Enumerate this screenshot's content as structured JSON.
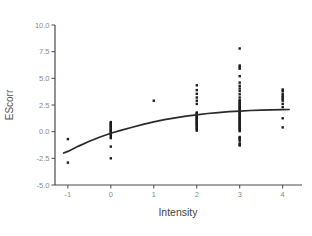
{
  "chart_data": {
    "type": "scatter",
    "title": "",
    "xlabel": "Intensity",
    "ylabel": "EScorr",
    "xlim": [
      -1.3,
      4.45
    ],
    "ylim": [
      -5,
      10
    ],
    "grid": false,
    "legend": null,
    "x_ticks": [
      "-1",
      "0",
      "1",
      "2",
      "3",
      "4"
    ],
    "x_tick_values": [
      -1,
      0,
      1,
      2,
      3,
      4
    ],
    "y_ticks": [
      "10.0",
      "7.5",
      "5.0",
      "2.5",
      "0.0",
      "-2.5",
      "-5.0"
    ],
    "y_tick_values": [
      10,
      7.5,
      5,
      2.5,
      0,
      -2.5,
      -5
    ],
    "point_color": "#1c1c1c",
    "curve_color": "#2a2a2a",
    "axis_color": "#4a4a4a",
    "tick_label_color": "#8a8a8a",
    "series": [
      {
        "name": "observations",
        "type": "scatter",
        "groups": [
          {
            "x": -1,
            "y": [
              -0.7,
              -2.9
            ]
          },
          {
            "x": 0,
            "y": [
              0.9,
              0.8,
              0.7,
              0.6,
              0.5,
              0.4,
              0.3,
              0.2,
              0.1,
              0.0,
              -0.1,
              -0.2,
              -0.3,
              -0.45,
              -0.6,
              -1.4,
              -2.5
            ]
          },
          {
            "x": 1,
            "y": [
              2.9
            ]
          },
          {
            "x": 2,
            "y": [
              4.35,
              3.9,
              3.55,
              3.2,
              2.9,
              2.6,
              1.8,
              1.72,
              1.64,
              1.56,
              1.48,
              1.4,
              1.32,
              1.24,
              1.16,
              1.08,
              1.0,
              0.92,
              0.84,
              0.76,
              0.68,
              0.6,
              0.5,
              0.4,
              0.3,
              0.2,
              0.1
            ]
          },
          {
            "x": 3,
            "y": [
              7.8,
              6.2,
              6.05,
              5.9,
              5.2,
              4.6,
              4.3,
              4.05,
              3.8,
              3.5,
              3.2,
              2.95,
              2.85,
              2.75,
              2.65,
              2.55,
              2.45,
              2.35,
              2.25,
              2.15,
              2.05,
              1.95,
              1.85,
              1.75,
              1.65,
              1.55,
              1.45,
              1.35,
              1.25,
              1.15,
              1.05,
              0.95,
              0.85,
              0.75,
              0.65,
              0.55,
              0.45,
              0.35,
              0.25,
              0.15,
              0.05,
              -0.5,
              -0.6,
              -0.7,
              -0.85,
              -1.1,
              -1.2,
              -1.3
            ]
          },
          {
            "x": 4,
            "y": [
              3.95,
              3.8,
              3.55,
              3.35,
              3.2,
              3.05,
              2.9,
              2.6,
              2.3,
              1.25,
              0.4
            ]
          }
        ]
      },
      {
        "name": "fit-curve",
        "type": "line",
        "points": [
          [
            -1.1,
            -2.0
          ],
          [
            -1,
            -1.85
          ],
          [
            -0.75,
            -1.35
          ],
          [
            -0.5,
            -0.9
          ],
          [
            -0.25,
            -0.5
          ],
          [
            0,
            -0.15
          ],
          [
            0.25,
            0.15
          ],
          [
            0.5,
            0.42
          ],
          [
            0.75,
            0.68
          ],
          [
            1,
            0.92
          ],
          [
            1.25,
            1.12
          ],
          [
            1.5,
            1.3
          ],
          [
            1.75,
            1.45
          ],
          [
            2,
            1.58
          ],
          [
            2.25,
            1.7
          ],
          [
            2.5,
            1.79
          ],
          [
            2.75,
            1.87
          ],
          [
            3,
            1.93
          ],
          [
            3.25,
            1.98
          ],
          [
            3.5,
            2.02
          ],
          [
            3.75,
            2.05
          ],
          [
            4,
            2.07
          ],
          [
            4.15,
            2.08
          ]
        ]
      }
    ]
  }
}
